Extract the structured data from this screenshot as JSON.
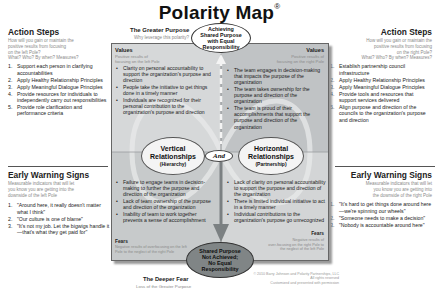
{
  "title": {
    "text": "Polarity Map",
    "mark": "®"
  },
  "greater_purpose": {
    "heading": "The Greater Purpose",
    "question": "Why leverage this polarity?",
    "oval": [
      "Achieving",
      "Shared Purpose",
      "with Equal",
      "Responsibility"
    ]
  },
  "deeper_fear": {
    "heading": "The Deeper Fear",
    "sub": "Loss of the Greater Purpose",
    "oval": [
      "Shared Purpose",
      "Not Achieved;",
      "No Equal",
      "Responsibility"
    ]
  },
  "left_pole": {
    "name": "Vertical",
    "name2": "Relationships",
    "paren": "(Hierarchy)",
    "values_label": "Values",
    "values_sub": [
      "Positive results of",
      "focusing on the left Pole"
    ],
    "values": [
      "Clarity on personal accountability to support the organization's purpose and direction",
      "People take the initiative to get things done in a timely manner",
      "Individuals are recognized for their personal contribution to the organization's purpose and direction"
    ],
    "fears_label": "Fears",
    "fears_sub": "Negative results of overfocusing on the left Pole to the neglect of the right Pole",
    "fears": [
      "Failure to engage teams in decision-making to further the purpose and direction of the organization",
      "Lack of team ownership of the purpose and direction of the organization",
      "Inability of team to work together prevents a sense of accomplishment"
    ]
  },
  "right_pole": {
    "name": "Horizontal",
    "name2": "Relationships",
    "paren": "(Partnership)",
    "values_label": "Values",
    "values_sub": [
      "Positive results of",
      "focusing on the right Pole"
    ],
    "values": [
      "The team engages in decision-making that impacts the purpose of the organization",
      "The team takes ownership for the purpose and direction of the organization",
      "The team is proud of their accomplishments that support the purpose and direction of the organization"
    ],
    "fears_label": "Fears",
    "fears_sub": [
      "Negative results of",
      "over-focusing on the right Pole to",
      "the neglect of the left Pole"
    ],
    "fears": [
      "Lack of clarity on personal accountability to support the purpose and direction of the organization",
      "There is limited individual initiative to act in a timely manner",
      "Individual contributions to the organization's purpose go unrecognized"
    ]
  },
  "and_label": "And",
  "left_action": {
    "heading": "Action Steps",
    "sub": [
      "How will you gain or maintain the",
      "positive results from focusing",
      "on the left Pole?",
      "What? Who? By when? Measures?"
    ],
    "items": [
      "Support each person in clarifying accountabilities",
      "Apply Healthy Relationship Principles",
      "Apply Meaningful Dialogue Principles",
      "Provide resources for individuals to independently carry out responsibilities",
      "Provide role clarification and performance criteria"
    ]
  },
  "right_action": {
    "heading": "Action Steps",
    "sub": [
      "How will you gain or maintain the",
      "positive results from focusing",
      "on the right Pole?",
      "What? Who? By when? Measures?"
    ],
    "items": [
      "Establish partnership council infrastructure",
      "Apply Healthy Relationship Principles",
      "Apply Meaningful Dialogue Principles",
      "Provide tools and resources that support services delivered",
      "Align purpose and direction of the councils to the organization's purpose and direction"
    ]
  },
  "left_warning": {
    "heading": "Early Warning Signs",
    "sub": [
      "Measurable indicators that will let",
      "you know you are getting into the",
      "downside of the left Pole"
    ],
    "items": [
      "\"Around here, it really doesn't matter what I think\"",
      "\"Our culture is one of blame\"",
      "\"It's not my job. Let the bigwigs handle it—that's what they get paid for\""
    ]
  },
  "right_warning": {
    "heading": "Early Warning Signs",
    "sub": [
      "Measurable indicators that will let",
      "you know you are getting into",
      "the downside of the right Pole"
    ],
    "items": [
      "\"It's hard to get things done around here—we're spinning our wheels\"",
      "\"Someone needs to make a decision\"",
      "\"Nobody is accountable around here\""
    ]
  },
  "copyright": [
    "© 2010 Barry Johnson and Polarity Partnerships, LLC",
    "All rights reserved",
    "Customized and presented with permission"
  ],
  "colors": {
    "frame_bg": "#c6c9cb",
    "oval_dark": "#808586",
    "border": "#666666"
  }
}
